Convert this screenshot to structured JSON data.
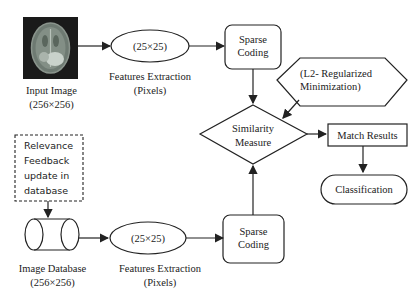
{
  "nodes": {
    "input_image": {
      "label": "Input Image",
      "size": "(256×256)"
    },
    "feature_top": {
      "ellipse": "(25×25)",
      "label": "Features Extraction",
      "sub": "(Pixels)"
    },
    "sparse_top": {
      "line1": "Sparse",
      "line2": "Coding"
    },
    "l2": {
      "line1": "(L2- Regularized",
      "line2": "Minimization)"
    },
    "similarity": {
      "line1": "Similarity",
      "line2": "Measure"
    },
    "match": {
      "label": "Match Results"
    },
    "classification": {
      "label": "Classification"
    },
    "relevance": {
      "line1": "Relevance",
      "line2": "Feedback",
      "line3": "update in",
      "line4": "database"
    },
    "database": {
      "label": "Image Database",
      "size": "(256×256)"
    },
    "feature_bottom": {
      "ellipse": "(25×25)",
      "label": "Features Extraction",
      "sub": "(Pixels)"
    },
    "sparse_bottom": {
      "line1": "Sparse",
      "line2": "Coding"
    }
  },
  "colors": {
    "stroke": "#222222",
    "background": "#ffffff"
  }
}
